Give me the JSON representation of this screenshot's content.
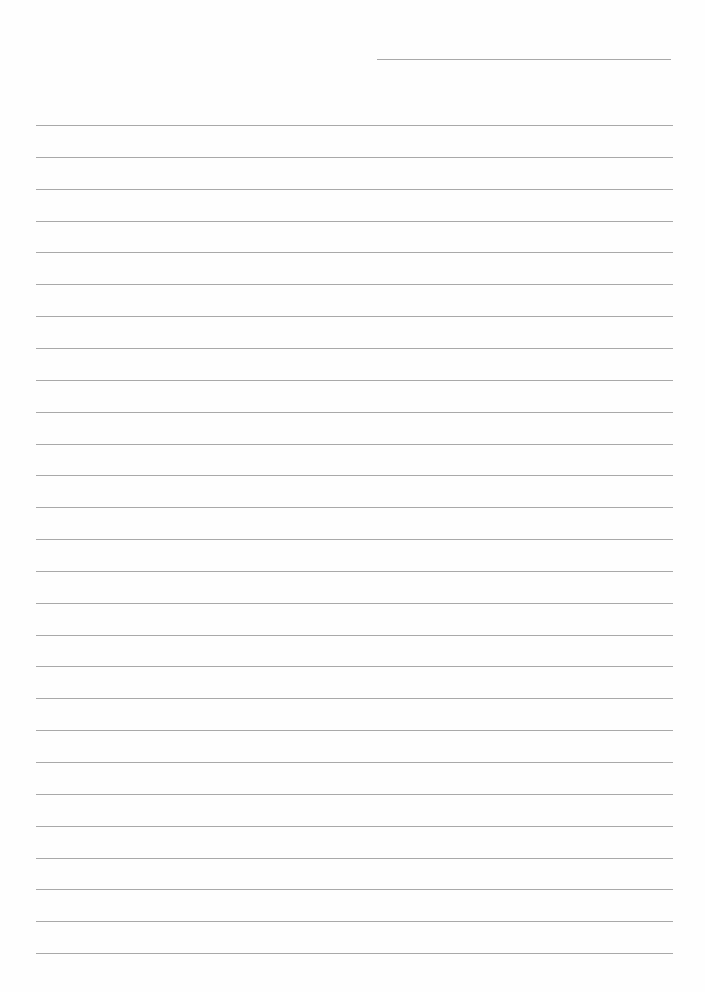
{
  "page": {
    "type": "lined-paper",
    "background": "#ffffff",
    "rule_color": "#a9a9a9",
    "header_line": {
      "x1": 377,
      "x2": 671,
      "y": 59
    },
    "ruled_lines": {
      "count": 27,
      "x1": 36,
      "x2": 673,
      "first_y": 125,
      "spacing": 31.85
    }
  }
}
